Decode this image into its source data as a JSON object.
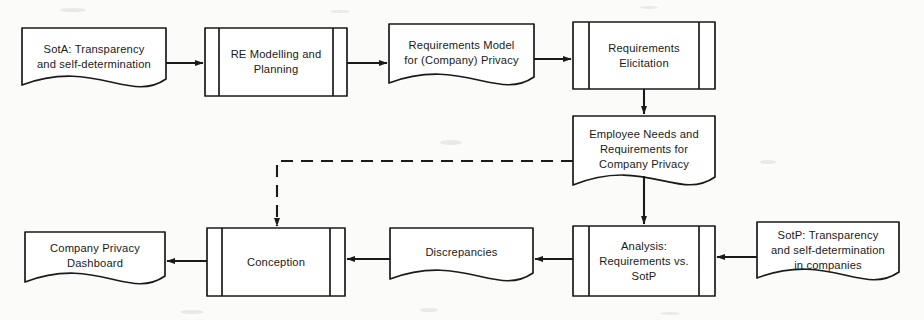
{
  "diagram": {
    "background_color": "#fbfbfa",
    "stroke_color": "#1a1a1a",
    "fill_color": "#ffffff",
    "nodes": [
      {
        "id": "sota",
        "label": "SotA: Transparency\nand self-determination",
        "shape": "document",
        "x": 22,
        "y": 28,
        "w": 144,
        "h": 68
      },
      {
        "id": "re-modelling",
        "label": "RE Modelling and\nPlanning",
        "shape": "predefined-process",
        "x": 205,
        "y": 28,
        "w": 142,
        "h": 68
      },
      {
        "id": "requirements-model",
        "label": "Requirements Model\nfor (Company) Privacy",
        "shape": "document",
        "x": 389,
        "y": 24,
        "w": 145,
        "h": 70
      },
      {
        "id": "requirements-elicitation",
        "label": "Requirements\nElicitation",
        "shape": "predefined-process",
        "x": 573,
        "y": 22,
        "w": 142,
        "h": 67
      },
      {
        "id": "employee-needs",
        "label": "Employee Needs and\nRequirements for\nCompany Privacy",
        "shape": "document",
        "x": 573,
        "y": 116,
        "w": 142,
        "h": 84
      },
      {
        "id": "sotp",
        "label": "SotP: Transparency\nand self-determination\nin companies",
        "shape": "document",
        "x": 757,
        "y": 222,
        "w": 142,
        "h": 70
      },
      {
        "id": "analysis",
        "label": "Analysis:\nRequirements vs.\nSotP",
        "shape": "predefined-process",
        "x": 573,
        "y": 226,
        "w": 142,
        "h": 70
      },
      {
        "id": "discrepancies",
        "label": "Discrepancies",
        "shape": "document",
        "x": 390,
        "y": 228,
        "w": 143,
        "h": 63
      },
      {
        "id": "conception",
        "label": "Conception",
        "shape": "predefined-process",
        "x": 207,
        "y": 228,
        "w": 138,
        "h": 68
      },
      {
        "id": "dashboard",
        "label": "Company Privacy\nDashboard",
        "shape": "document",
        "x": 25,
        "y": 232,
        "w": 140,
        "h": 63
      }
    ],
    "edges": [
      {
        "id": "sota-to-re-modelling",
        "from": "sota",
        "to": "re-modelling",
        "style": "solid",
        "direction": "right"
      },
      {
        "id": "re-modelling-to-requirements-model",
        "from": "re-modelling",
        "to": "requirements-model",
        "style": "solid",
        "direction": "right"
      },
      {
        "id": "requirements-model-to-elicitation",
        "from": "requirements-model",
        "to": "requirements-elicitation",
        "style": "solid",
        "direction": "right"
      },
      {
        "id": "elicitation-to-employee-needs",
        "from": "requirements-elicitation",
        "to": "employee-needs",
        "style": "solid",
        "direction": "down"
      },
      {
        "id": "employee-needs-to-analysis",
        "from": "employee-needs",
        "to": "analysis",
        "style": "solid",
        "direction": "down"
      },
      {
        "id": "sotp-to-analysis",
        "from": "sotp",
        "to": "analysis",
        "style": "solid",
        "direction": "left"
      },
      {
        "id": "analysis-to-discrepancies",
        "from": "analysis",
        "to": "discrepancies",
        "style": "solid",
        "direction": "left"
      },
      {
        "id": "discrepancies-to-conception",
        "from": "discrepancies",
        "to": "conception",
        "style": "solid",
        "direction": "left"
      },
      {
        "id": "conception-to-dashboard",
        "from": "conception",
        "to": "dashboard",
        "style": "solid",
        "direction": "left"
      },
      {
        "id": "employee-needs-to-conception",
        "from": "employee-needs",
        "to": "conception",
        "style": "dashed",
        "direction": "down"
      }
    ]
  }
}
